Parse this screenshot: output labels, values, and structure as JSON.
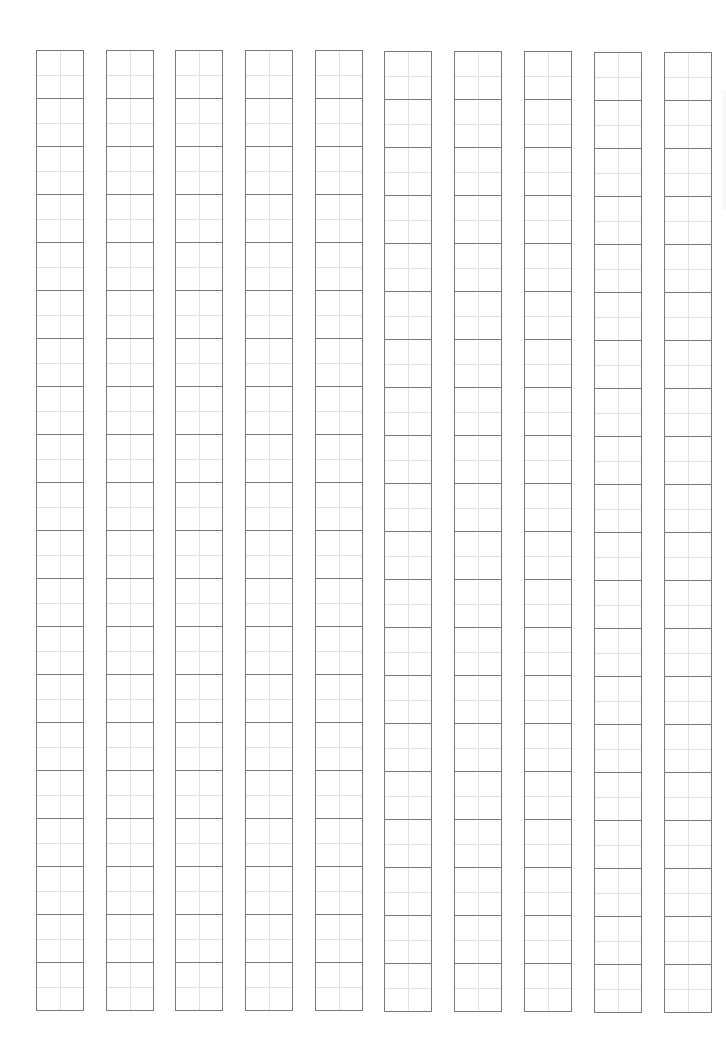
{
  "sheet": {
    "type": "tianzige-writing-practice-grid",
    "columns": 10,
    "rows_per_column": 20,
    "cell_size_px": 48,
    "column_width_px": 48,
    "column_left_px": [
      36,
      106,
      175,
      245,
      315,
      384,
      454,
      524,
      594,
      664
    ],
    "column_top_px": [
      50,
      50,
      50,
      50,
      50,
      51,
      51,
      51,
      52,
      52
    ],
    "colors": {
      "background": "#ffffff",
      "cell_border": "#7a7a7a",
      "guide_line": "#e2e2e2"
    }
  }
}
